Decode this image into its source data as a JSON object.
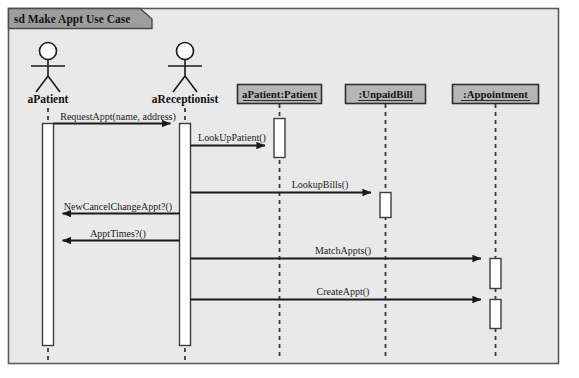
{
  "diagram": {
    "kind": "uml-sequence-diagram",
    "frame_title": "sd Make Appt Use Case",
    "colors": {
      "canvas": "#ffffff",
      "frame_fill": "#e8e8e8",
      "frame_border": "#555555",
      "title_fill": "#9d9d9d",
      "object_box_fill": "#b4b4b4",
      "object_box_border": "#333333",
      "activation_fill": "#ffffff",
      "activation_border": "#444444",
      "line": "#1a1a1a",
      "lifeline_dash": "#3a3a3a"
    },
    "actors": [
      {
        "id": "aPatient",
        "label": "aPatient",
        "x": 48
      },
      {
        "id": "aReceptionist",
        "label": "aReceptionist",
        "x": 185
      }
    ],
    "objects": [
      {
        "id": "patient",
        "label": "aPatient:Patient",
        "x": 279,
        "box_left": 237,
        "box_width": 84
      },
      {
        "id": "unpaidbill",
        "label": ":UnpaidBill",
        "x": 385,
        "box_left": 345,
        "box_width": 80
      },
      {
        "id": "appointment",
        "label": ":Appointment",
        "x": 495,
        "box_left": 452,
        "box_width": 86
      }
    ],
    "messages": [
      {
        "label": "RequestAppt(name, address)",
        "from": "aPatient",
        "to": "aReceptionist",
        "y": 123,
        "direction": "right"
      },
      {
        "label": "LookUpPatient()",
        "from": "aReceptionist",
        "to": "patient",
        "y": 145,
        "direction": "right"
      },
      {
        "label": "LookupBills()",
        "from": "aReceptionist",
        "to": "unpaidbill",
        "y": 192,
        "direction": "right"
      },
      {
        "label": "NewCancelChangeAppt?()",
        "from": "aReceptionist",
        "to": "aPatient",
        "y": 213,
        "direction": "left"
      },
      {
        "label": "ApptTimes?()",
        "from": "aReceptionist",
        "to": "aPatient",
        "y": 240,
        "direction": "left"
      },
      {
        "label": "MatchAppts()",
        "from": "aReceptionist",
        "to": "appointment",
        "y": 258,
        "direction": "right"
      },
      {
        "label": "CreateAppt()",
        "from": "aReceptionist",
        "to": "appointment",
        "y": 299,
        "direction": "right"
      }
    ],
    "activations": [
      {
        "on": "aPatient",
        "x": 48,
        "top": 123,
        "bottom": 345,
        "width": 11
      },
      {
        "on": "aReceptionist",
        "x": 185,
        "top": 123,
        "bottom": 345,
        "width": 11
      },
      {
        "on": "patient",
        "x": 279,
        "top": 118,
        "bottom": 157,
        "width": 11
      },
      {
        "on": "unpaidbill",
        "x": 385,
        "top": 192,
        "bottom": 217,
        "width": 11
      },
      {
        "on": "appointment",
        "x": 495,
        "top": 258,
        "bottom": 288,
        "width": 11
      },
      {
        "on": "appointment",
        "x": 495,
        "top": 299,
        "bottom": 328,
        "width": 11
      }
    ]
  }
}
